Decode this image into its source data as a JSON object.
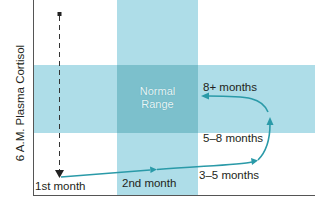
{
  "figure": {
    "y_axis_label": "6 A.M. Plasma Cortisol",
    "normal_range_label_line1": "Normal",
    "normal_range_label_line2": "Range",
    "stages": [
      {
        "label": "1st month"
      },
      {
        "label": "2nd month"
      },
      {
        "label": "3–5 months"
      },
      {
        "label": "5–8 months"
      },
      {
        "label": "8+ months"
      }
    ]
  },
  "colors": {
    "band": "#aedde8",
    "overlap": "#7cc0cc",
    "arrow": "#2a9aa8",
    "axis": "#555555",
    "dashed": "#333333"
  }
}
